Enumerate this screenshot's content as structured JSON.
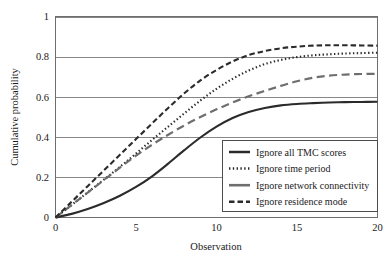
{
  "chart_data": {
    "type": "line",
    "title": "",
    "xlabel": "Observation",
    "ylabel": "Cumulative probability",
    "xlim": [
      0,
      20
    ],
    "ylim": [
      0,
      1
    ],
    "xticks": [
      0,
      5,
      10,
      15,
      20
    ],
    "yticks": [
      0,
      0.2,
      0.4,
      0.6,
      0.8,
      1
    ],
    "xtick_labels": [
      "0",
      "5",
      "10",
      "15",
      "20"
    ],
    "ytick_labels": [
      "0",
      "0.2",
      "0.4",
      "0.6",
      "0.8",
      "1"
    ],
    "grid": "horizontal",
    "legend_position": "lower right",
    "x": [
      0,
      1,
      2,
      3,
      4,
      5,
      6,
      7,
      8,
      9,
      10,
      11,
      12,
      13,
      14,
      15,
      16,
      17,
      18,
      19,
      20
    ],
    "series": [
      {
        "name": "Ignore all TMC scores",
        "style": "solid",
        "color": "#2b2b2b",
        "width": 2.1,
        "dash": "",
        "values": [
          0.0,
          0.018,
          0.042,
          0.072,
          0.108,
          0.152,
          0.205,
          0.268,
          0.335,
          0.398,
          0.452,
          0.495,
          0.525,
          0.545,
          0.558,
          0.565,
          0.569,
          0.572,
          0.574,
          0.575,
          0.576
        ]
      },
      {
        "name": "Ignore time period",
        "style": "dotted",
        "color": "#2b2b2b",
        "width": 2.1,
        "dash": "1.4,2.4",
        "values": [
          0.0,
          0.062,
          0.125,
          0.188,
          0.252,
          0.318,
          0.386,
          0.452,
          0.518,
          0.582,
          0.64,
          0.69,
          0.731,
          0.763,
          0.784,
          0.798,
          0.807,
          0.812,
          0.816,
          0.818,
          0.82
        ]
      },
      {
        "name": "Ignore network connectivity",
        "style": "long-dash",
        "color": "#6e6e6e",
        "width": 2.2,
        "dash": "8,4.5",
        "values": [
          0.0,
          0.062,
          0.124,
          0.186,
          0.248,
          0.308,
          0.362,
          0.412,
          0.458,
          0.5,
          0.538,
          0.572,
          0.603,
          0.63,
          0.655,
          0.678,
          0.695,
          0.706,
          0.711,
          0.714,
          0.715
        ]
      },
      {
        "name": "Ignore residence mode",
        "style": "dashed",
        "color": "#2b2b2b",
        "width": 2.1,
        "dash": "5.5,3",
        "values": [
          0.0,
          0.078,
          0.156,
          0.234,
          0.312,
          0.39,
          0.468,
          0.545,
          0.618,
          0.682,
          0.734,
          0.776,
          0.808,
          0.828,
          0.842,
          0.85,
          0.855,
          0.857,
          0.857,
          0.856,
          0.855
        ]
      }
    ]
  },
  "legend": {
    "items": [
      {
        "label": "Ignore all TMC scores"
      },
      {
        "label": "Ignore time period"
      },
      {
        "label": "Ignore network connectivity"
      },
      {
        "label": "Ignore residence mode"
      }
    ]
  },
  "axes": {
    "y_title": "Cumulative probability",
    "x_title": "Observation"
  }
}
